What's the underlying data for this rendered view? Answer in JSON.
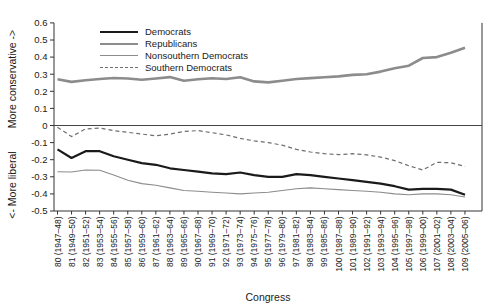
{
  "figure": {
    "xlabel": "Congress",
    "ylabel_top": "More conservative ->",
    "ylabel_bottom": "<- More liberal"
  },
  "chart_data": {
    "type": "line",
    "title": "",
    "xlabel": "Congress",
    "ylabel_top": "More conservative ->",
    "ylabel_bottom": "<- More liberal",
    "ylim": [
      -0.5,
      0.6
    ],
    "grid": false,
    "zero_line": true,
    "legend_position": "top-inside",
    "yticks": [
      0.6,
      0.5,
      0.4,
      0.3,
      0.2,
      0.1,
      0,
      -0.1,
      -0.2,
      -0.3,
      -0.4,
      -0.5
    ],
    "ytick_labels": [
      "0.6",
      "0.5",
      "0.4",
      "0.3",
      "0.2",
      "0.1",
      "0",
      "-0.1",
      "-0.2",
      "-0.3",
      "-0.4",
      "-0.5"
    ],
    "categories": [
      "80 (1947–48)",
      "81 (1949–50)",
      "82 (1951–52)",
      "83 (1953–54)",
      "84 (1955–56)",
      "85 (1957–58)",
      "86 (1959–60)",
      "87 (1961–62)",
      "88 (1963–64)",
      "89 (1965–66)",
      "90 (1967–68)",
      "91 (1969–70)",
      "92 (1971–72)",
      "93 (1973–74)",
      "94 (1975–76)",
      "95 (1977–78)",
      "96 (1979–80)",
      "97 (1981–82)",
      "98 (1983–84)",
      "99 (1985–86)",
      "100 (1987–88)",
      "101 (1989–90)",
      "102 (1991–92)",
      "103 (1993–94)",
      "104 (1995–96)",
      "105 (1997–98)",
      "106 (1999–00)",
      "107 (2001–02)",
      "108 (2003–04)",
      "109 (2005–06)"
    ],
    "series": [
      {
        "name": "Democrats",
        "color": "#1a1a1a",
        "line_width": 2.2,
        "dash": "",
        "values": [
          -0.14,
          -0.19,
          -0.15,
          -0.15,
          -0.18,
          -0.2,
          -0.22,
          -0.23,
          -0.25,
          -0.26,
          -0.27,
          -0.28,
          -0.285,
          -0.275,
          -0.29,
          -0.3,
          -0.3,
          -0.285,
          -0.29,
          -0.3,
          -0.31,
          -0.32,
          -0.33,
          -0.34,
          -0.355,
          -0.375,
          -0.37,
          -0.37,
          -0.375,
          -0.405
        ]
      },
      {
        "name": "Republicans",
        "color": "#8c8c8c",
        "line_width": 2.6,
        "dash": "",
        "values": [
          0.27,
          0.255,
          0.265,
          0.272,
          0.278,
          0.275,
          0.268,
          0.275,
          0.283,
          0.262,
          0.27,
          0.276,
          0.272,
          0.282,
          0.258,
          0.252,
          0.262,
          0.272,
          0.277,
          0.282,
          0.287,
          0.296,
          0.3,
          0.315,
          0.335,
          0.35,
          0.395,
          0.4,
          0.425,
          0.455
        ]
      },
      {
        "name": "Nonsouthern Democrats",
        "color": "#8c8c8c",
        "line_width": 1.1,
        "dash": "",
        "values": [
          -0.27,
          -0.272,
          -0.26,
          -0.262,
          -0.29,
          -0.32,
          -0.34,
          -0.35,
          -0.365,
          -0.38,
          -0.385,
          -0.39,
          -0.395,
          -0.4,
          -0.395,
          -0.39,
          -0.38,
          -0.37,
          -0.365,
          -0.37,
          -0.375,
          -0.38,
          -0.385,
          -0.39,
          -0.4,
          -0.405,
          -0.4,
          -0.4,
          -0.405,
          -0.418
        ]
      },
      {
        "name": "Southern Democrats",
        "color": "#6e6e6e",
        "line_width": 1.2,
        "dash": "4 3",
        "values": [
          -0.01,
          -0.065,
          -0.02,
          -0.015,
          -0.03,
          -0.04,
          -0.05,
          -0.06,
          -0.05,
          -0.035,
          -0.03,
          -0.042,
          -0.055,
          -0.075,
          -0.09,
          -0.1,
          -0.115,
          -0.14,
          -0.155,
          -0.165,
          -0.17,
          -0.165,
          -0.172,
          -0.185,
          -0.205,
          -0.235,
          -0.26,
          -0.215,
          -0.218,
          -0.24
        ]
      }
    ]
  }
}
